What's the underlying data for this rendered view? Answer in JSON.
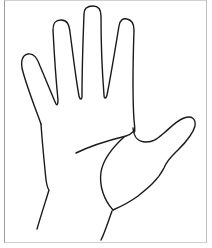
{
  "figure": {
    "stroke_color": "#1a1a1a",
    "frame_color": "#9a9a9a",
    "background": "#ffffff"
  }
}
